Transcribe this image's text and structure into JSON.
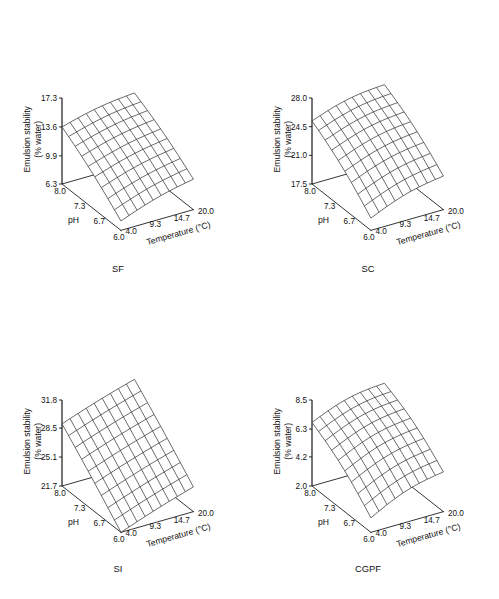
{
  "figure": {
    "background": "#ffffff",
    "ink": "#111111",
    "panel_count": 4
  },
  "common": {
    "zaxis_label_line1": "Emulsion stability",
    "zaxis_label_line2": "(% water)",
    "xaxis_label": "pH",
    "yaxis_label": "Temperature (°C)",
    "ph_ticks": [
      "8.0",
      "7.3",
      "6.7",
      "6.0"
    ],
    "temperature_ticks": [
      "4.0",
      "9.3",
      "14.7",
      "20.0"
    ]
  },
  "chart_data": [
    {
      "type": "surface",
      "title": "SF",
      "xlabel": "pH",
      "ylabel": "Temperature (°C)",
      "zlabel": "Emulsion stability (% water)",
      "x": [
        8.0,
        7.3,
        6.7,
        6.0
      ],
      "y": [
        4.0,
        9.3,
        14.7,
        20.0
      ],
      "xlim": [
        6.0,
        8.0
      ],
      "ylim": [
        4.0,
        20.0
      ],
      "zlim": [
        6.3,
        17.3
      ],
      "zticks": [
        "6.3",
        "9.9",
        "13.6",
        "17.3"
      ],
      "ztick_values": [
        6.3,
        9.9,
        13.6,
        17.3
      ],
      "grid": true,
      "mesh_divisions": 9,
      "corner_values": {
        "ph8_temp4": 13.6,
        "ph8_temp20": 15.3,
        "ph6_temp4": 7.5,
        "ph6_temp20": 10.2
      },
      "description": "Near-planar surface rising with increasing pH and temperature"
    },
    {
      "type": "surface",
      "title": "SC",
      "xlabel": "pH",
      "ylabel": "Temperature (°C)",
      "zlabel": "Emulsion stability (% water)",
      "x": [
        8.0,
        7.3,
        6.7,
        6.0
      ],
      "y": [
        4.0,
        9.3,
        14.7,
        20.0
      ],
      "xlim": [
        6.0,
        8.0
      ],
      "ylim": [
        4.0,
        20.0
      ],
      "zlim": [
        17.5,
        28.0
      ],
      "zticks": [
        "17.5",
        "21.0",
        "24.5",
        "28.0"
      ],
      "ztick_values": [
        17.5,
        21.0,
        24.5,
        28.0
      ],
      "grid": true,
      "mesh_divisions": 9,
      "corner_values": {
        "ph8_temp4": 25.2,
        "ph8_temp20": 27.1,
        "ph6_temp4": 19.0,
        "ph6_temp20": 21.6
      },
      "description": "Surface rising steeply toward high pH, slight curvature"
    },
    {
      "type": "surface",
      "title": "SI",
      "xlabel": "pH",
      "ylabel": "Temperature (°C)",
      "zlabel": "Emulsion stability (% water)",
      "x": [
        8.0,
        7.3,
        6.7,
        6.0
      ],
      "y": [
        4.0,
        9.3,
        14.7,
        20.0
      ],
      "xlim": [
        6.0,
        8.0
      ],
      "ylim": [
        4.0,
        20.0
      ],
      "zlim": [
        21.7,
        31.8
      ],
      "zticks": [
        "21.7",
        "25.1",
        "28.5",
        "31.8"
      ],
      "ztick_values": [
        21.7,
        25.1,
        28.5,
        31.8
      ],
      "grid": true,
      "mesh_divisions": 9,
      "corner_values": {
        "ph8_temp4": 29.0,
        "ph8_temp20": 31.8,
        "ph6_temp4": 21.7,
        "ph6_temp20": 24.6
      },
      "description": "Strongly tilted planar surface, steepest gradient of the four"
    },
    {
      "type": "surface",
      "title": "CGPF",
      "xlabel": "pH",
      "ylabel": "Temperature (°C)",
      "zlabel": "Emulsion stability (% water)",
      "x": [
        8.0,
        7.3,
        6.7,
        6.0
      ],
      "y": [
        4.0,
        9.3,
        14.7,
        20.0
      ],
      "xlim": [
        6.0,
        8.0
      ],
      "ylim": [
        4.0,
        20.0
      ],
      "zlim": [
        2.0,
        8.5
      ],
      "zticks": [
        "2.0",
        "4.2",
        "6.3",
        "8.5"
      ],
      "ztick_values": [
        2.0,
        4.2,
        6.3,
        8.5
      ],
      "grid": true,
      "mesh_divisions": 9,
      "corner_values": {
        "ph8_temp4": 6.8,
        "ph8_temp20": 8.2,
        "ph6_temp4": 3.1,
        "ph6_temp20": 5.0
      },
      "description": "Curved surface increasing with pH and temperature"
    }
  ]
}
